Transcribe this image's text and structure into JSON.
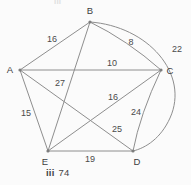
{
  "figure": {
    "caption_top_fragment": "iii",
    "caption_label": "iii",
    "caption_value": "74",
    "background_color": "#fbfbfb",
    "line_color": "#8e8e8e",
    "text_color": "#4a4a4a"
  },
  "graph": {
    "type": "weighted-undirected-graph",
    "vertices": [
      {
        "id": "A",
        "label": "A",
        "x": 20,
        "y": 70,
        "label_x": 10,
        "label_y": 70
      },
      {
        "id": "B",
        "label": "B",
        "x": 90,
        "y": 22,
        "label_x": 90,
        "label_y": 11
      },
      {
        "id": "C",
        "label": "C",
        "x": 161,
        "y": 70,
        "label_x": 170,
        "label_y": 71
      },
      {
        "id": "D",
        "label": "D",
        "x": 133,
        "y": 151,
        "label_x": 137,
        "label_y": 162
      },
      {
        "id": "E",
        "label": "E",
        "x": 48,
        "y": 151,
        "label_x": 45,
        "label_y": 162
      }
    ],
    "edges": [
      {
        "from": "A",
        "to": "B",
        "weight": "16",
        "label_x": 52,
        "label_y": 40,
        "curved": false
      },
      {
        "from": "B",
        "to": "C",
        "weight": "8",
        "label_x": 131,
        "label_y": 43,
        "curved": false
      },
      {
        "from": "A",
        "to": "C",
        "weight": "10",
        "label_x": 112,
        "label_y": 64,
        "curved": false
      },
      {
        "from": "B",
        "to": "D",
        "weight": "22",
        "label_x": 177,
        "label_y": 50,
        "curved": true
      },
      {
        "from": "B",
        "to": "E",
        "weight": "27",
        "label_x": 60,
        "label_y": 84,
        "curved": false
      },
      {
        "from": "A",
        "to": "E",
        "weight": "15",
        "label_x": 26,
        "label_y": 114,
        "curved": false
      },
      {
        "from": "C",
        "to": "E",
        "weight": "16",
        "label_x": 113,
        "label_y": 98,
        "curved": false
      },
      {
        "from": "C",
        "to": "D",
        "weight": "24",
        "label_x": 136,
        "label_y": 113,
        "curved": true
      },
      {
        "from": "A",
        "to": "D",
        "weight": "25",
        "label_x": 117,
        "label_y": 130,
        "curved": false
      },
      {
        "from": "E",
        "to": "D",
        "weight": "19",
        "label_x": 90,
        "label_y": 160,
        "curved": false
      }
    ]
  }
}
